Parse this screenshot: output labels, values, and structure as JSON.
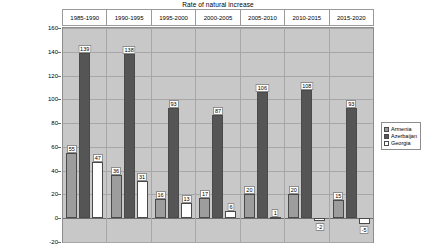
{
  "chart_data": {
    "type": "bar",
    "title": "Rate of natural increase",
    "xlabel": "",
    "ylabel": "Thousands",
    "ylim": [
      -20,
      160
    ],
    "yticks": [
      160,
      140,
      120,
      100,
      80,
      60,
      40,
      20,
      0,
      -20
    ],
    "grid": true,
    "legend_position": "right",
    "categories": [
      "1985-1990",
      "1990-1995",
      "1995-2000",
      "2000-2005",
      "2005-2010",
      "2010-2015",
      "2015-2020"
    ],
    "series": [
      {
        "name": "Armenia",
        "color": "#9d9d9d",
        "values": [
          55,
          36,
          16,
          17,
          20,
          20,
          15
        ]
      },
      {
        "name": "Azerbaijan",
        "color": "#555555",
        "values": [
          139,
          138,
          93,
          87,
          106,
          108,
          93
        ]
      },
      {
        "name": "Georgia",
        "color": "#ffffff",
        "values": [
          47,
          31,
          13,
          6,
          1,
          -2,
          -5
        ]
      }
    ]
  },
  "legend": {
    "items": [
      {
        "label": "Armenia"
      },
      {
        "label": "Azerbaijan"
      },
      {
        "label": "Georgia"
      }
    ]
  }
}
